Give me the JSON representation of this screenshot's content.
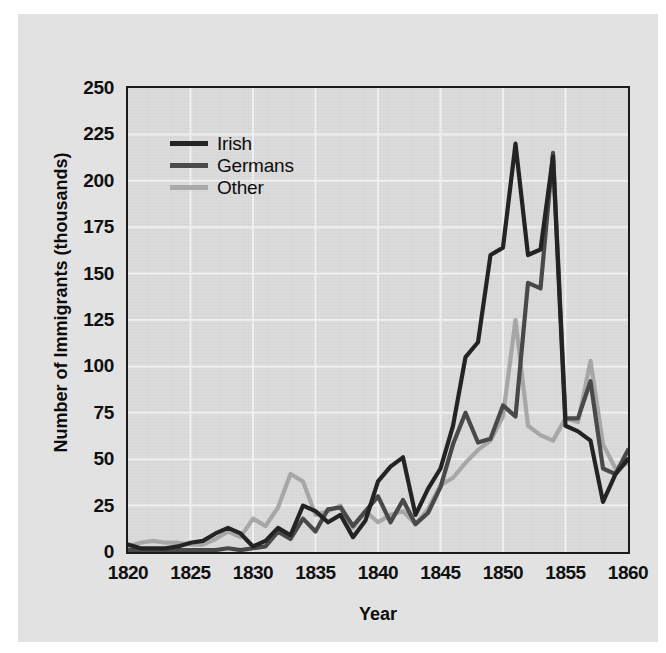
{
  "chart_data": {
    "type": "line",
    "title": "",
    "xlabel": "Year",
    "ylabel": "Number of Immigrants (thousands)",
    "xlim": [
      1820,
      1860
    ],
    "ylim": [
      0,
      250
    ],
    "xticks": [
      1820,
      1825,
      1830,
      1835,
      1840,
      1845,
      1850,
      1855,
      1860
    ],
    "yticks": [
      0,
      25,
      50,
      75,
      100,
      125,
      150,
      175,
      200,
      225,
      250
    ],
    "grid": true,
    "legend_position": "upper-left-inside",
    "x": [
      1820,
      1821,
      1822,
      1823,
      1824,
      1825,
      1826,
      1827,
      1828,
      1829,
      1830,
      1831,
      1832,
      1833,
      1834,
      1835,
      1836,
      1837,
      1838,
      1839,
      1840,
      1841,
      1842,
      1843,
      1844,
      1845,
      1846,
      1847,
      1848,
      1849,
      1850,
      1851,
      1852,
      1853,
      1854,
      1855,
      1856,
      1857,
      1858,
      1859,
      1860
    ],
    "series": [
      {
        "name": "Irish",
        "color": "#242424",
        "values": [
          4,
          2,
          2,
          2,
          3,
          5,
          6,
          10,
          13,
          10,
          3,
          6,
          13,
          9,
          25,
          22,
          16,
          20,
          8,
          17,
          38,
          46,
          51,
          20,
          34,
          45,
          68,
          105,
          113,
          160,
          164,
          220,
          160,
          163,
          213,
          68,
          65,
          60,
          27,
          42,
          50
        ]
      },
      {
        "name": "Germans",
        "color": "#4a4a4a",
        "values": [
          1,
          1,
          1,
          1,
          1,
          1,
          1,
          1,
          2,
          1,
          2,
          3,
          11,
          7,
          18,
          11,
          23,
          24,
          14,
          22,
          30,
          16,
          28,
          15,
          21,
          35,
          58,
          75,
          59,
          61,
          79,
          73,
          145,
          142,
          215,
          72,
          72,
          92,
          45,
          42,
          55
        ]
      },
      {
        "name": "Other",
        "color": "#a9a9a9",
        "values": [
          3,
          5,
          6,
          5,
          5,
          4,
          4,
          7,
          11,
          8,
          18,
          14,
          24,
          42,
          38,
          20,
          22,
          25,
          13,
          22,
          16,
          20,
          22,
          15,
          23,
          36,
          40,
          48,
          55,
          60,
          73,
          125,
          68,
          63,
          60,
          72,
          70,
          103,
          58,
          45,
          48
        ]
      }
    ]
  },
  "legend": {
    "items": [
      {
        "label": "Irish",
        "color": "#242424"
      },
      {
        "label": "Germans",
        "color": "#4a4a4a"
      },
      {
        "label": "Other",
        "color": "#a9a9a9"
      }
    ]
  },
  "axes": {
    "y_label": "Number of Immigrants (thousands)",
    "x_label": "Year",
    "y_ticks": [
      "250",
      "225",
      "200",
      "175",
      "150",
      "125",
      "100",
      "75",
      "50",
      "25",
      "0"
    ],
    "x_ticks": [
      "1820",
      "1825",
      "1830",
      "1835",
      "1840",
      "1845",
      "1850",
      "1855",
      "1860"
    ]
  },
  "colors": {
    "page_background": "#ffffff",
    "figure_background": "#e2e2e2",
    "plot_background": "#dcdcdc",
    "axis_line": "#1b1b1b",
    "gridline": "#f2f2f2",
    "irish": "#242424",
    "germans": "#4a4a4a",
    "other": "#a9a9a9"
  }
}
